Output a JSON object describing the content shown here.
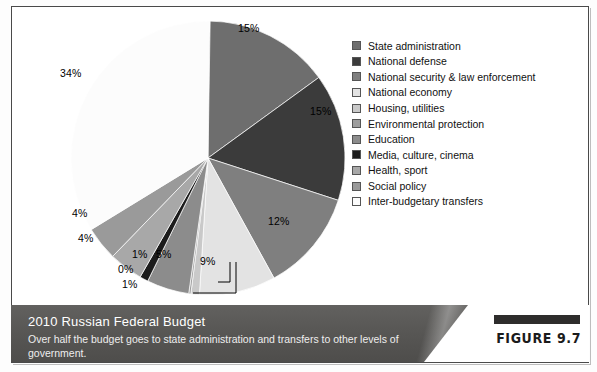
{
  "figure": {
    "tag": "FIGURE 9.7",
    "title": "2010 Russian Federal Budget",
    "subtitle": "Over half the budget goes to state administration and transfers to other levels of government."
  },
  "chart_data": {
    "type": "pie",
    "title": "2010 Russian Federal Budget",
    "xlabel": "",
    "ylabel": "",
    "legend_position": "right",
    "grid": false,
    "units": "percent",
    "start_angle_deg": 0,
    "direction": "clockwise",
    "categories": [
      "State administration",
      "National defense",
      "National security & law enforcement",
      "National economy",
      "Housing, utilities",
      "Environmental protection",
      "Education",
      "Media, culture, cinema",
      "Health, sport",
      "Social policy",
      "Inter-budgetary transfers"
    ],
    "values": [
      15,
      15,
      12,
      9,
      1,
      0,
      5,
      1,
      4,
      4,
      34
    ],
    "labels": [
      "15%",
      "15%",
      "12%",
      "9%",
      "1%",
      "0%",
      "5%",
      "1%",
      "4%",
      "4%",
      "34%"
    ],
    "colors": [
      "#6e6e6e",
      "#3b3b3b",
      "#7f7f7f",
      "#e3e3e3",
      "#c9c9c9",
      "#9e9e9e",
      "#8c8c8c",
      "#1c1c1c",
      "#a8a8a8",
      "#9a9a9a",
      "#fcfcfc"
    ],
    "leader_lines": [
      "Environmental protection",
      "Housing, utilities"
    ]
  }
}
